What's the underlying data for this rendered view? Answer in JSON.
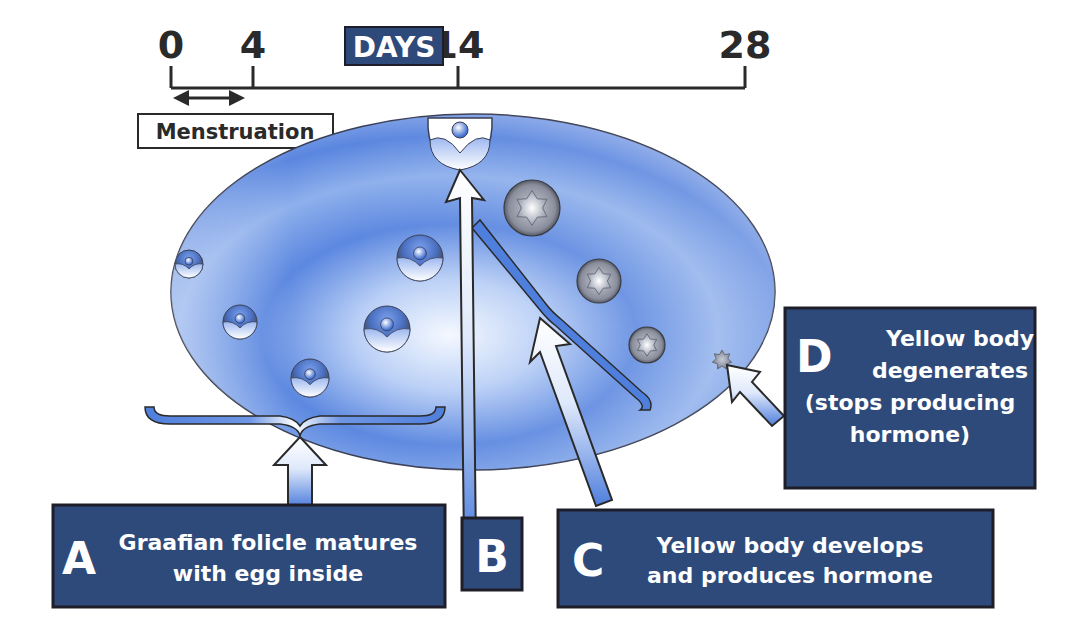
{
  "timeline": {
    "axis_label": "DAYS",
    "ticks": [
      {
        "day": 0,
        "label": "0"
      },
      {
        "day": 4,
        "label": "4"
      },
      {
        "day": 14,
        "label": "14"
      },
      {
        "day": 28,
        "label": "28"
      }
    ],
    "range": [
      0,
      28
    ],
    "menstruation": {
      "label": "Menstruation",
      "start_day": 0,
      "end_day": 4
    }
  },
  "stages": [
    {
      "letter": "A",
      "lines": [
        "Graafian folicle matures",
        "with egg inside"
      ]
    },
    {
      "letter": "B",
      "lines": []
    },
    {
      "letter": "C",
      "lines": [
        "Yellow body develops",
        "and produces hormone"
      ]
    },
    {
      "letter": "D",
      "lines": [
        "Yellow body",
        "degenerates",
        "(stops producing",
        "hormone)"
      ]
    }
  ],
  "colors": {
    "box_fill": "#2e4a7a",
    "box_border": "#1e1e2a",
    "ovary_blue": "#4f7fdd",
    "ovary_light": "#eaf2ff",
    "line": "#2a2a2a",
    "yellow_body_dark": "#5a5a66"
  }
}
